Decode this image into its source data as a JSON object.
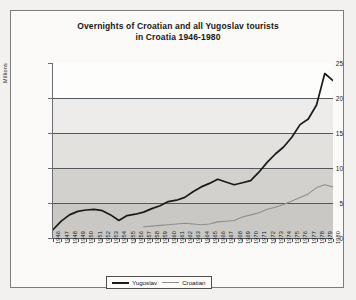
{
  "figure": {
    "title_line1": "Overnights of Croatian and all Yugoslav tourists",
    "title_line2": "in Croatia 1946-1980",
    "frame_color": "#7c7c7c",
    "background_color": "#fbfaf8"
  },
  "legend": {
    "position": "bottom-center",
    "entries": [
      {
        "label": "Yugoslav",
        "color": "#1a1a1a",
        "swatch": "thick-line"
      },
      {
        "label": "Croatian",
        "color": "#8e8e8e",
        "swatch": "thin-line"
      }
    ]
  },
  "axes": {
    "y_title": "Millions",
    "y_ticks": [
      "0",
      "5",
      "10",
      "15",
      "20",
      "25"
    ],
    "x_ticks": [
      "1946",
      "1947",
      "1948",
      "1949",
      "1950",
      "1951",
      "1952",
      "1953",
      "1954",
      "1955",
      "1956",
      "1957",
      "1958",
      "1959",
      "1960",
      "1961",
      "1962",
      "1963",
      "1964",
      "1965",
      "1966",
      "1967",
      "1968",
      "1969",
      "1970",
      "1971",
      "1972",
      "1973",
      "1974",
      "1975",
      "1976",
      "1977",
      "1978",
      "1979",
      "1980"
    ]
  },
  "chart_data": {
    "type": "line",
    "title": "Overnights of Croatian and all Yugoslav tourists in Croatia 1946-1980",
    "xlabel": "",
    "ylabel": "Millions",
    "ylim": [
      0,
      25
    ],
    "ytick_step": 5,
    "grid": "horizontal",
    "legend_position": "bottom-center",
    "categories": [
      "1946",
      "1947",
      "1948",
      "1949",
      "1950",
      "1951",
      "1952",
      "1953",
      "1954",
      "1955",
      "1956",
      "1957",
      "1958",
      "1959",
      "1960",
      "1961",
      "1962",
      "1963",
      "1964",
      "1965",
      "1966",
      "1967",
      "1968",
      "1969",
      "1970",
      "1971",
      "1972",
      "1973",
      "1974",
      "1975",
      "1976",
      "1977",
      "1978",
      "1979",
      "1980"
    ],
    "series": [
      {
        "name": "Yugoslav",
        "color": "#1a1a1a",
        "values": [
          1.2,
          2.4,
          3.3,
          3.8,
          4.0,
          4.1,
          3.9,
          3.3,
          2.5,
          3.2,
          3.4,
          3.7,
          4.2,
          4.6,
          5.2,
          5.4,
          5.8,
          6.6,
          7.3,
          7.8,
          8.4,
          8.0,
          7.6,
          7.9,
          8.2,
          9.4,
          10.8,
          12.0,
          13.0,
          14.4,
          16.2,
          17.0,
          19.0,
          23.5,
          22.5
        ]
      },
      {
        "name": "Croatian",
        "color": "#8e8e8e",
        "values": [
          null,
          null,
          null,
          null,
          null,
          null,
          null,
          null,
          null,
          null,
          null,
          1.6,
          1.7,
          1.8,
          1.9,
          2.0,
          2.1,
          2.0,
          1.9,
          2.0,
          2.3,
          2.4,
          2.5,
          3.0,
          3.3,
          3.6,
          4.1,
          4.4,
          4.8,
          5.3,
          5.8,
          6.3,
          7.2,
          7.6,
          7.3
        ]
      }
    ]
  }
}
